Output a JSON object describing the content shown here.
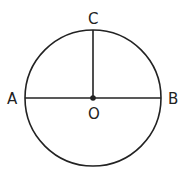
{
  "diagram": {
    "type": "circle-geometry",
    "stroke_color": "#222222",
    "background": "#ffffff",
    "circle": {
      "center": "O",
      "cx": 93,
      "cy": 98,
      "r": 68
    },
    "points": {
      "A": {
        "label": "A",
        "x": 25,
        "y": 98
      },
      "B": {
        "label": "B",
        "x": 161,
        "y": 98
      },
      "C": {
        "label": "C",
        "x": 93,
        "y": 30
      },
      "O": {
        "label": "O",
        "x": 93,
        "y": 98
      }
    },
    "segments": [
      {
        "from": "A",
        "to": "B",
        "name": "diameter AB"
      },
      {
        "from": "O",
        "to": "C",
        "name": "radius OC"
      }
    ]
  }
}
